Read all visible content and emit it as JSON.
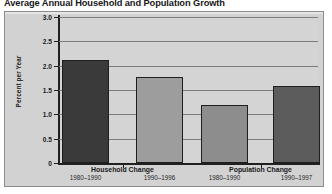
{
  "chart_data": {
    "type": "bar",
    "title": "Average Annual Household and Population Growth",
    "xlabel": "",
    "ylabel": "Percent per Year",
    "ylim": [
      0,
      3.0
    ],
    "ytick_labels": [
      "0",
      "0.5",
      "1.0",
      "1.5",
      "2.0",
      "2.5",
      "3.0"
    ],
    "ytick_values": [
      0,
      0.5,
      1.0,
      1.5,
      2.0,
      2.5,
      3.0
    ],
    "grid": true,
    "legend": "none",
    "groups": [
      {
        "name": "Household Change",
        "bars": [
          {
            "period": "1980–1990",
            "value": 2.12,
            "color": "#3a3a3a"
          },
          {
            "period": "1990–1996",
            "value": 1.76,
            "color": "#9d9d9d"
          }
        ]
      },
      {
        "name": "Population Change",
        "bars": [
          {
            "period": "1980–1990",
            "value": 1.2,
            "color": "#8d8d8d"
          },
          {
            "period": "1990–1997",
            "value": 1.58,
            "color": "#5c5c5c"
          }
        ]
      }
    ],
    "categories": [
      "Household Change 1980–1990",
      "Household Change 1990–1996",
      "Population Change 1980–1990",
      "Population Change 1990–1997"
    ],
    "values": [
      2.12,
      1.76,
      1.2,
      1.58
    ]
  },
  "figure": {
    "background_color": "#d2d2d2",
    "plot_background_color": "#d4d4d4",
    "axis_color": "#202020",
    "gridline_color": "#7d7d7d"
  }
}
